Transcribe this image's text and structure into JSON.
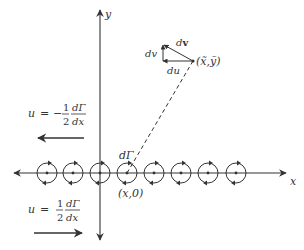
{
  "diagram": {
    "axes": {
      "x_label": "x",
      "y_label": "y"
    },
    "vortex_sheet": {
      "vortex_count": 8,
      "centers_x": [
        47,
        73,
        100,
        127,
        154,
        181,
        208,
        236
      ],
      "axis_y": 173,
      "radius": 10,
      "highlighted_label": "dΓ",
      "highlighted_point_label": "(x,0)"
    },
    "target_point": {
      "label": "(x̃,ỹ)",
      "triangle_labels": {
        "dv": "dv",
        "du": "du",
        "dvec": "dv"
      }
    },
    "velocity_upper": {
      "lhs": "u",
      "eq": "=",
      "sign": "−",
      "frac_num": "1",
      "frac_den": "2",
      "deriv_num": "dΓ",
      "deriv_den": "dx",
      "arrow_direction": "left"
    },
    "velocity_lower": {
      "lhs": "u",
      "eq": "=",
      "sign": "",
      "frac_num": "1",
      "frac_den": "2",
      "deriv_num": "dΓ",
      "deriv_den": "dx",
      "arrow_direction": "right"
    },
    "colors": {
      "stroke": "#333333",
      "background": "#ffffff"
    }
  }
}
